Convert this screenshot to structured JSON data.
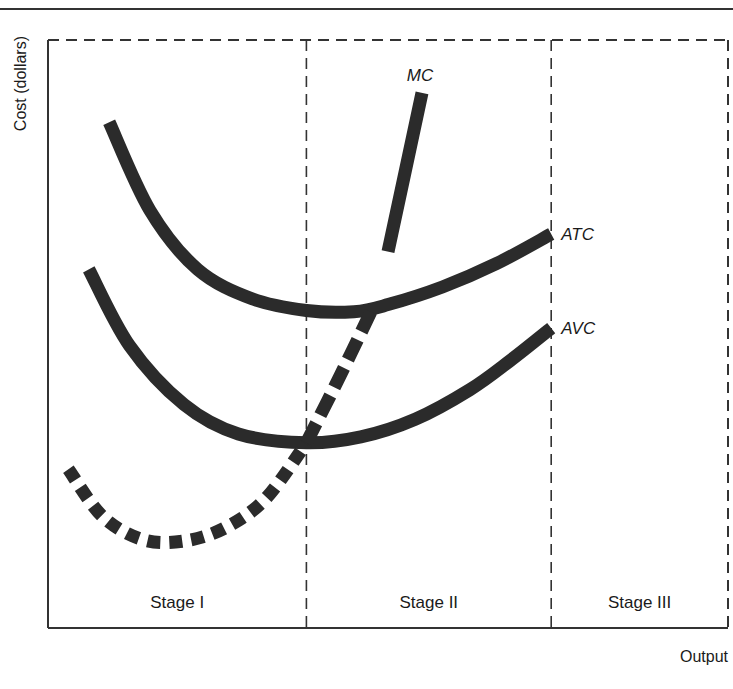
{
  "chart_data": {
    "type": "line",
    "title": "",
    "xlabel": "Output",
    "ylabel": "Cost (dollars)",
    "xlim": [
      0,
      100
    ],
    "ylim": [
      0,
      100
    ],
    "grid": false,
    "ticks": "none",
    "stage_boundaries": [
      38,
      74
    ],
    "stages": [
      {
        "label": "Stage I",
        "x_range": [
          0,
          38
        ]
      },
      {
        "label": "Stage II",
        "x_range": [
          38,
          74
        ]
      },
      {
        "label": "Stage III",
        "x_range": [
          74,
          100
        ]
      }
    ],
    "series": [
      {
        "name": "ATC",
        "label": "ATC",
        "style": "solid",
        "x": [
          9,
          15,
          22,
          30,
          38,
          45,
          50,
          58,
          66,
          74
        ],
        "y": [
          86,
          71,
          61,
          56,
          54,
          53.8,
          55,
          58,
          62,
          67
        ]
      },
      {
        "name": "AVC",
        "label": "AVC",
        "style": "solid",
        "x": [
          6,
          12,
          20,
          28,
          38,
          46,
          54,
          62,
          68,
          74
        ],
        "y": [
          61,
          48,
          38,
          33,
          31.5,
          32.5,
          35.5,
          40.5,
          45.5,
          51
        ]
      },
      {
        "name": "MC",
        "label": "MC",
        "style": "dotted-then-dashed-then-solid",
        "x": [
          3,
          8,
          14,
          20,
          26,
          32,
          38,
          43,
          47.5,
          50,
          55
        ],
        "y": [
          27,
          19,
          15,
          14.8,
          17,
          22,
          31.5,
          43,
          53.8,
          64,
          91
        ]
      }
    ],
    "style_segments": {
      "MC": [
        {
          "x_range": [
            3,
            38
          ],
          "style": "dotted"
        },
        {
          "x_range": [
            38,
            48
          ],
          "style": "dashed"
        },
        {
          "x_range": [
            48,
            55
          ],
          "style": "solid"
        }
      ]
    },
    "line_color": "#2b2b2b"
  }
}
